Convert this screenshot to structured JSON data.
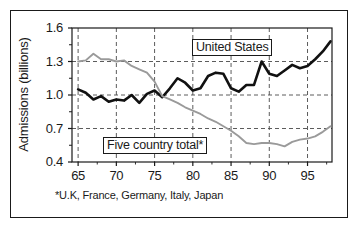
{
  "chart_data": {
    "type": "line",
    "title": "",
    "xlabel": "",
    "ylabel": "Admissions (billions)",
    "xlim": [
      64.2,
      98.2
    ],
    "ylim": [
      0.4,
      1.6
    ],
    "xticks": [
      "65",
      "70",
      "75",
      "80",
      "85",
      "90",
      "95"
    ],
    "xtick_values": [
      65,
      70,
      75,
      80,
      85,
      90,
      95
    ],
    "yticks": [
      "1.6",
      "1.3",
      "1.0",
      "0.7",
      "0.4"
    ],
    "ytick_values": [
      1.6,
      1.3,
      1.0,
      0.7,
      0.4
    ],
    "minor_yticks": [
      1.45,
      1.15,
      0.85,
      0.55
    ],
    "grid": "dashed, major x and y",
    "legend_position": "inline-boxed-labels",
    "footnote": "*U.K, France, Germany, Italy, Japan",
    "x": [
      65,
      66,
      67,
      68,
      69,
      70,
      71,
      72,
      73,
      74,
      75,
      76,
      77,
      78,
      79,
      80,
      81,
      82,
      83,
      84,
      85,
      86,
      87,
      88,
      89,
      90,
      91,
      92,
      93,
      94,
      95,
      96,
      97,
      98
    ],
    "series": [
      {
        "name": "United States",
        "label": "United States",
        "color": "#111111",
        "width": 2.6,
        "values": [
          1.05,
          1.02,
          0.96,
          0.99,
          0.94,
          0.96,
          0.95,
          1.0,
          0.93,
          1.01,
          1.04,
          0.98,
          1.06,
          1.15,
          1.11,
          1.04,
          1.06,
          1.17,
          1.2,
          1.19,
          1.06,
          1.03,
          1.09,
          1.09,
          1.3,
          1.19,
          1.17,
          1.22,
          1.27,
          1.24,
          1.26,
          1.32,
          1.39,
          1.48
        ]
      },
      {
        "name": "Five country total*",
        "label": "Five country total*",
        "color": "#9a9a9a",
        "width": 1.9,
        "values": [
          1.3,
          1.31,
          1.37,
          1.32,
          1.32,
          1.3,
          1.31,
          1.26,
          1.23,
          1.2,
          1.12,
          0.99,
          0.96,
          0.93,
          0.89,
          0.86,
          0.83,
          0.79,
          0.76,
          0.72,
          0.68,
          0.63,
          0.57,
          0.56,
          0.57,
          0.57,
          0.56,
          0.54,
          0.58,
          0.6,
          0.61,
          0.63,
          0.67,
          0.72
        ]
      }
    ]
  }
}
